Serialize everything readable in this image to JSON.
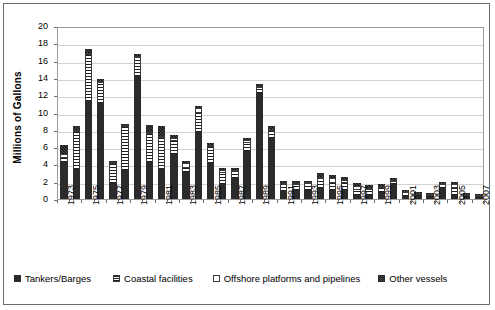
{
  "chart_data": {
    "type": "bar",
    "stacked": true,
    "title": "",
    "xlabel": "",
    "ylabel": "Millions of Gallons",
    "ylim": [
      0,
      20
    ],
    "yticks": [
      0,
      2,
      4,
      6,
      8,
      10,
      12,
      14,
      16,
      18,
      20
    ],
    "grid": true,
    "legend_position": "bottom",
    "x_tick_label_step": 2,
    "categories": [
      "1973",
      "1974",
      "1975",
      "1976",
      "1977",
      "1978",
      "1979",
      "1980",
      "1981",
      "1982",
      "1983",
      "1984",
      "1985",
      "1986",
      "1987",
      "1988",
      "1989",
      "1990",
      "1991",
      "1992",
      "1993",
      "1994",
      "1995",
      "1996",
      "1997",
      "1998",
      "1999",
      "2000",
      "2001",
      "2002",
      "2003",
      "2004",
      "2005",
      "2006",
      "2007"
    ],
    "x_tick_labels": [
      "1973",
      "",
      "1975",
      "",
      "1977",
      "",
      "1979",
      "",
      "1981",
      "",
      "1983",
      "",
      "1985",
      "",
      "1987",
      "",
      "1989",
      "",
      "1991",
      "",
      "1993",
      "",
      "1995",
      "",
      "1997",
      "",
      "1999",
      "",
      "2001",
      "",
      "2003",
      "",
      "2005",
      "",
      "2007"
    ],
    "series": [
      {
        "name": "Tankers/Barges",
        "color": "#2b2b2b",
        "pattern": "solid",
        "values": [
          4.3,
          3.5,
          11.3,
          11.1,
          1.8,
          3.3,
          14.2,
          4.3,
          3.5,
          5.2,
          3.1,
          7.7,
          4.2,
          1.7,
          2.4,
          5.5,
          12.2,
          7.0,
          0.9,
          1.0,
          1.1,
          1.3,
          1.0,
          1.1,
          0.5,
          0.5,
          0.8,
          1.7,
          0.4,
          0.3,
          0.2,
          1.3,
          0.5,
          0.2,
          0.15
        ]
      },
      {
        "name": "Coastal facilities",
        "color": "#ffffff",
        "pattern": "horizontal-stripes",
        "values": [
          0.5,
          4.3,
          5.4,
          2.3,
          2.2,
          5.0,
          2.1,
          3.2,
          3.6,
          1.5,
          0.5,
          2.3,
          1.8,
          1.3,
          0.7,
          1.0,
          0.6,
          0.9,
          0.7,
          0.6,
          0.6,
          1.0,
          0.9,
          0.8,
          0.5,
          0.6,
          0.5,
          0.3,
          0.25,
          0.2,
          0.2,
          0.3,
          0.8,
          0.2,
          0.1
        ]
      },
      {
        "name": "Offshore platforms and pipelines",
        "color": "#ffffff",
        "pattern": "empty",
        "values": [
          0.4,
          0.2,
          0.2,
          0.1,
          0.2,
          0.1,
          0.2,
          0.3,
          0.2,
          0.4,
          0.6,
          0.5,
          0.2,
          0.4,
          0.2,
          0.3,
          0.2,
          0.2,
          0.15,
          0.2,
          0.2,
          0.3,
          0.5,
          0.3,
          0.5,
          0.2,
          0.2,
          0.15,
          0.1,
          0.1,
          0.1,
          0.15,
          0.4,
          0.1,
          0.05
        ]
      },
      {
        "name": "Other vessels",
        "color": "#4e4e4e",
        "pattern": "dotted",
        "values": [
          1.0,
          0.4,
          0.4,
          0.2,
          0.2,
          0.2,
          0.2,
          0.8,
          1.1,
          0.3,
          0.2,
          0.3,
          0.3,
          0.2,
          0.2,
          0.3,
          0.3,
          0.3,
          0.25,
          0.2,
          0.2,
          0.4,
          0.4,
          0.3,
          0.3,
          0.25,
          0.2,
          0.15,
          0.15,
          0.1,
          0.1,
          0.15,
          0.3,
          0.1,
          0.05
        ]
      }
    ],
    "totals": [
      6.2,
      8.4,
      17.3,
      13.7,
      4.4,
      8.6,
      16.7,
      8.6,
      8.4,
      7.4,
      4.4,
      10.8,
      6.5,
      3.6,
      3.5,
      7.1,
      13.3,
      8.4,
      2.0,
      2.0,
      2.1,
      3.0,
      2.8,
      2.5,
      1.8,
      1.55,
      1.7,
      2.3,
      0.9,
      0.7,
      0.6,
      1.9,
      2.0,
      0.6,
      0.35
    ]
  },
  "legend": {
    "items": [
      {
        "label": "Tankers/Barges"
      },
      {
        "label": "Coastal facilities"
      },
      {
        "label": "Offshore platforms and pipelines"
      },
      {
        "label": "Other vessels"
      }
    ]
  }
}
